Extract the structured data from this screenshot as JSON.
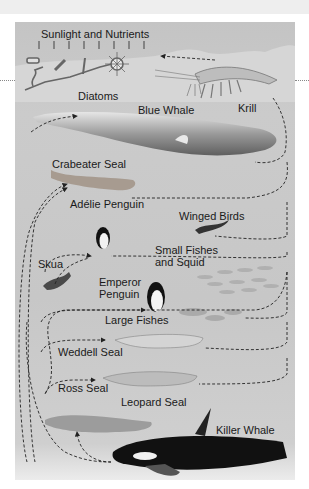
{
  "diagram": {
    "type": "food-web",
    "header_label": "Sunlight and Nutrients",
    "organisms": [
      {
        "id": "diatoms",
        "label": "Diatoms"
      },
      {
        "id": "krill",
        "label": "Krill"
      },
      {
        "id": "blue_whale",
        "label": "Blue Whale"
      },
      {
        "id": "crabeater_seal",
        "label": "Crabeater Seal"
      },
      {
        "id": "winged_birds",
        "label": "Winged Birds"
      },
      {
        "id": "adelie_penguin",
        "label": "Adélie Penguin"
      },
      {
        "id": "skua",
        "label": "Skua"
      },
      {
        "id": "small_fishes_squid",
        "label": "Small Fishes and Squid"
      },
      {
        "id": "emperor_penguin",
        "label": "Emperor Penguin"
      },
      {
        "id": "large_fishes",
        "label": "Large Fishes"
      },
      {
        "id": "weddell_seal",
        "label": "Weddell Seal"
      },
      {
        "id": "ross_seal",
        "label": "Ross Seal"
      },
      {
        "id": "leopard_seal",
        "label": "Leopard Seal"
      },
      {
        "id": "killer_whale",
        "label": "Killer Whale"
      }
    ],
    "arrows": [
      {
        "from": "krill",
        "to": "diatoms"
      },
      {
        "from": "krill",
        "to": "blue_whale"
      },
      {
        "from": "krill",
        "to": "crabeater_seal"
      },
      {
        "from": "krill",
        "to": "winged_birds"
      },
      {
        "from": "krill",
        "to": "adelie_penguin"
      },
      {
        "from": "small_fishes_squid",
        "to": "emperor_penguin"
      },
      {
        "from": "large_fishes",
        "to": "weddell_seal"
      },
      {
        "from": "ross_seal",
        "to": "leopard_seal"
      },
      {
        "from": "adelie_penguin",
        "to": "skua"
      },
      {
        "from": "killer_whale",
        "to": "leopard_seal"
      }
    ]
  }
}
